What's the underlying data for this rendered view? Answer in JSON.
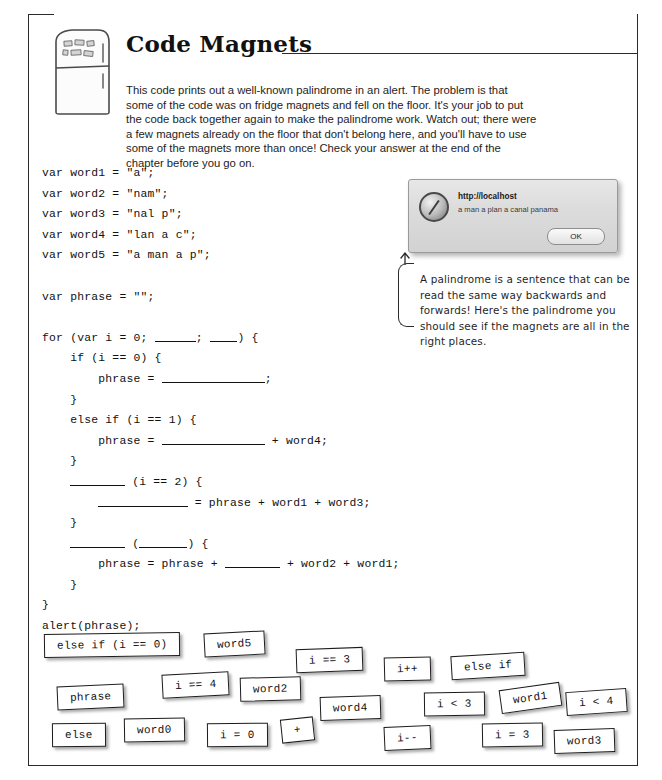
{
  "page": {
    "title": "Code Magnets",
    "icon": "fridge-icon",
    "intro": "This code prints out a well-known palindrome in an alert. The problem is that some of the code was on fridge magnets and fell on the floor. It's your job to put the code back together again to make the palindrome work. Watch out; there were a few magnets already on the floor that don't belong here, and you'll have to use some of the magnets more than once! Check your answer at the end of the chapter before you go on."
  },
  "code": {
    "lines": [
      "var word1 = \"a\";",
      "var word2 = \"nam\";",
      "var word3 = \"nal p\";",
      "var word4 = \"lan a c\";",
      "var word5 = \"a man a p\";",
      "",
      "var phrase = \"\";",
      "",
      "for (var i = 0; ______; ____) {",
      "    if (i == 0) {",
      "        phrase = _______________;",
      "    }",
      "    else if (i == 1) {",
      "        phrase = _______________ + word4;",
      "    }",
      "    ________ (i == 2) {",
      "        _____________ = phrase + word1 + word3;",
      "    }",
      "    ________ (_______) {",
      "        phrase = phrase + ________ + word2 + word1;",
      "    }",
      "}",
      "alert(phrase);"
    ]
  },
  "alert_window": {
    "host": "http://localhost",
    "message": "a man a plan a canal panama",
    "ok_label": "OK",
    "icon": "compass-icon"
  },
  "annotation": {
    "text": "A palindrome is a sentence that can be read the same way backwards and forwards! Here's the palindrome you should see if the magnets are all in the right places."
  },
  "magnets": [
    {
      "label": "else if (i == 0)",
      "x": 44,
      "y": 633,
      "rot": -0.8
    },
    {
      "label": "word5",
      "x": 204,
      "y": 632,
      "rot": -3.0
    },
    {
      "label": "i == 3",
      "x": 296,
      "y": 648,
      "rot": -2.0
    },
    {
      "label": "i++",
      "x": 384,
      "y": 657,
      "rot": -1.5
    },
    {
      "label": "else if",
      "x": 451,
      "y": 654,
      "rot": -3.5
    },
    {
      "label": "i == 4",
      "x": 162,
      "y": 673,
      "rot": -3.0
    },
    {
      "label": "word2",
      "x": 240,
      "y": 677,
      "rot": -1.5
    },
    {
      "label": "phrase",
      "x": 57,
      "y": 685,
      "rot": -2.5
    },
    {
      "label": "word4",
      "x": 320,
      "y": 696,
      "rot": -2.0
    },
    {
      "label": "i < 3",
      "x": 424,
      "y": 692,
      "rot": -0.8
    },
    {
      "label": "word1",
      "x": 500,
      "y": 686,
      "rot": -8.0
    },
    {
      "label": "i < 4",
      "x": 566,
      "y": 690,
      "rot": -4.0
    },
    {
      "label": "else",
      "x": 52,
      "y": 723,
      "rot": -0.5
    },
    {
      "label": "word0",
      "x": 124,
      "y": 718,
      "rot": -1.0
    },
    {
      "label": "i = 0",
      "x": 207,
      "y": 723,
      "rot": -0.5
    },
    {
      "label": "+",
      "x": 281,
      "y": 718,
      "rot": -6.0
    },
    {
      "label": "i--",
      "x": 384,
      "y": 726,
      "rot": -2.5
    },
    {
      "label": "i = 3",
      "x": 482,
      "y": 723,
      "rot": -1.0
    },
    {
      "label": "word3",
      "x": 554,
      "y": 729,
      "rot": -2.0
    }
  ]
}
